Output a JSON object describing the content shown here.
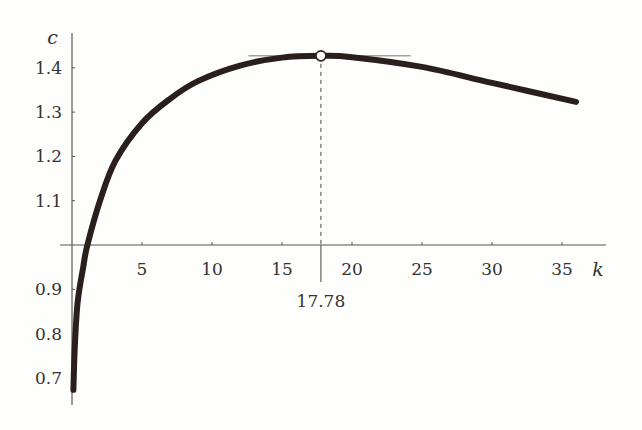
{
  "chart_data": {
    "type": "line",
    "title": "",
    "xlabel": "k",
    "ylabel": "c",
    "xlim": [
      0,
      38
    ],
    "ylim": [
      0.66,
      1.47
    ],
    "x_axis_crosses_at_y": 1.0,
    "grid": false,
    "x_ticks": [
      5,
      10,
      15,
      20,
      25,
      30,
      35
    ],
    "x_tick_labels": [
      "5",
      "10",
      "15",
      "20",
      "25",
      "30",
      "35"
    ],
    "y_ticks": [
      0.7,
      0.8,
      0.9,
      1.1,
      1.2,
      1.3,
      1.4
    ],
    "y_tick_labels": [
      "0.7",
      "0.8",
      "0.9",
      "1.1",
      "1.2",
      "1.3",
      "1.4"
    ],
    "series": [
      {
        "name": "c(k)",
        "color": "#2a1f1c",
        "x": [
          0.1,
          0.2,
          0.4,
          0.8,
          1.1,
          2,
          3.1,
          5,
          7,
          9,
          12,
          15,
          17.78,
          20,
          25,
          30,
          36
        ],
        "y": [
          0.673,
          0.77,
          0.87,
          0.95,
          1.0,
          1.1,
          1.19,
          1.275,
          1.33,
          1.37,
          1.405,
          1.423,
          1.427,
          1.424,
          1.402,
          1.366,
          1.323
        ]
      }
    ],
    "annotations": {
      "maximum": {
        "k": 17.78,
        "c": 1.427,
        "label": "17.78"
      },
      "tangent_line": {
        "k_from": 12.6,
        "k_to": 24.2,
        "c": 1.427
      }
    }
  }
}
